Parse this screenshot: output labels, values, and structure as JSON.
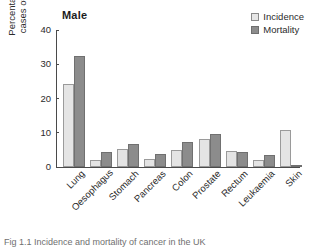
{
  "chart_data": {
    "type": "bar",
    "title": "Male",
    "xlabel": "",
    "ylabel": "Percentage of all cases of cancer",
    "ylabel_line1": "Percentage of all",
    "ylabel_line2": "cases of cancer",
    "ylim": [
      0,
      40
    ],
    "yticks": [
      0,
      10,
      20,
      30,
      40
    ],
    "ytick_labels": [
      "0",
      "10",
      "20",
      "30",
      "40"
    ],
    "grid": false,
    "legend_position": "top-right",
    "categories": [
      "Lung",
      "Oesophagus",
      "Stomach",
      "Pancreas",
      "Colon",
      "Prostate",
      "Rectum",
      "Leukaemia",
      "Skin"
    ],
    "series": [
      {
        "name": "Incidence",
        "color": "#e4e4e4",
        "values": [
          24.2,
          2.0,
          5.2,
          2.3,
          5.0,
          8.3,
          4.7,
          2.0,
          10.9
        ]
      },
      {
        "name": "Mortality",
        "color": "#8c8c8c",
        "values": [
          32.5,
          4.5,
          6.8,
          3.8,
          7.3,
          9.7,
          4.5,
          3.5,
          0.3
        ]
      }
    ]
  },
  "legend": {
    "items": [
      {
        "label": "Incidence",
        "swatch": "incidence"
      },
      {
        "label": "Mortality",
        "swatch": "mortality"
      }
    ]
  },
  "caption": {
    "text": "Fig 1.1  Incidence and mortality of cancer in the UK"
  },
  "colors": {
    "incidence_fill": "#e4e4e4",
    "incidence_stroke": "#9a9a9a",
    "mortality_fill": "#8c8c8c",
    "mortality_stroke": "#707070",
    "axis": "#4a4a4a",
    "text": "#2b2b2b"
  }
}
